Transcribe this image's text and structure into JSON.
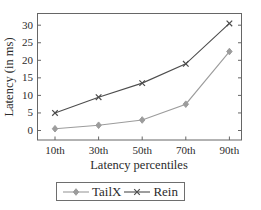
{
  "chart_data": {
    "type": "line",
    "title": "",
    "categories": [
      "10th",
      "30th",
      "50th",
      "70th",
      "90th"
    ],
    "series": [
      {
        "name": "TailX",
        "values": [
          0.5,
          1.5,
          3,
          7.5,
          22.5
        ],
        "color": "#9c9c9c",
        "marker": "diamond"
      },
      {
        "name": "Rein",
        "values": [
          5,
          9.5,
          13.5,
          19,
          30.5
        ],
        "color": "#4d4d4d",
        "marker": "x"
      }
    ],
    "xlabel": "Latency percentiles",
    "ylabel": "Latency (in ms)",
    "yticks": [
      0,
      5,
      10,
      15,
      20,
      25,
      30
    ],
    "ylim": [
      0,
      30
    ],
    "grid": false,
    "legend_position": "bottom"
  },
  "colors": {
    "axis": "#666666",
    "text": "#2b2b2b",
    "background": "#ffffff",
    "legend_border": "#6e6e6e"
  }
}
